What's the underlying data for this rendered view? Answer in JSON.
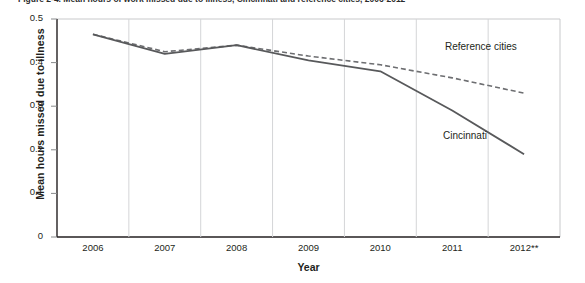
{
  "figure": {
    "caption": "Figure 2-4.  Mean hours of work missed due to illness, Cincinnati and reference cities, 2006-2012"
  },
  "chart_data": {
    "type": "line",
    "title": "",
    "xlabel": "Year",
    "ylabel": "Mean hours missed due to illness",
    "categories": [
      "2006",
      "2007",
      "2008",
      "2009",
      "2010",
      "2011",
      "2012**"
    ],
    "x_tick_labels": [
      "2006",
      "2007",
      "2008",
      "2009",
      "2010",
      "2011",
      "2012**"
    ],
    "y_tick_labels": [
      "0",
      "0.1",
      "0.2",
      "0.3",
      "0.4",
      "0.5"
    ],
    "y_tick_values": [
      0,
      0.1,
      0.2,
      0.3,
      0.4,
      0.5
    ],
    "ylim": [
      0,
      0.5
    ],
    "grid": false,
    "legend_position": "inline-annotation",
    "series": [
      {
        "name": "Reference cities",
        "style": "dashed",
        "color": "#6d6e71",
        "values": [
          0.465,
          0.425,
          0.44,
          0.415,
          0.395,
          0.365,
          0.33
        ]
      },
      {
        "name": "Cincinnati",
        "style": "solid",
        "color": "#58595b",
        "values": [
          0.465,
          0.42,
          0.44,
          0.405,
          0.38,
          0.29,
          0.19
        ]
      }
    ],
    "annotations": [
      {
        "text": "Reference cities",
        "series": "Reference cities"
      },
      {
        "text": "Cincinnati",
        "series": "Cincinnati"
      }
    ]
  },
  "colors": {
    "reference_cities_line": "#6d6e71",
    "cincinnati_line": "#58595b",
    "axis": "#231f20",
    "frame": "#c8c9cb",
    "background": "#ffffff"
  }
}
